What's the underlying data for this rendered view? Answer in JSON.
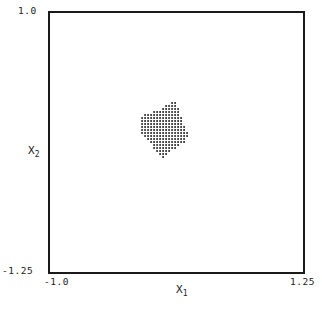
{
  "chart_data": {
    "type": "scatter",
    "title": "",
    "xlabel": "x1",
    "ylabel": "x2",
    "xlim": [
      -1.0,
      1.25
    ],
    "ylim": [
      -1.25,
      1.0
    ],
    "x_ticks": [
      "-1.0",
      "1.25"
    ],
    "y_ticks": [
      "1.0",
      "-1.25"
    ],
    "grid": false,
    "legend": null,
    "point_grid_spacing": 0.027,
    "region": {
      "x_range": [
        -0.21,
        0.23
      ],
      "y_range": [
        -0.25,
        0.22
      ],
      "outline": [
        [
          0.07,
          0.22
        ],
        [
          0.12,
          0.22
        ],
        [
          0.15,
          0.15
        ],
        [
          0.18,
          0.05
        ],
        [
          0.23,
          -0.05
        ],
        [
          0.2,
          -0.12
        ],
        [
          0.1,
          -0.18
        ],
        [
          0.0,
          -0.25
        ],
        [
          -0.06,
          -0.2
        ],
        [
          -0.13,
          -0.1
        ],
        [
          -0.2,
          -0.05
        ],
        [
          -0.21,
          0.05
        ],
        [
          -0.17,
          0.12
        ],
        [
          -0.06,
          0.15
        ],
        [
          0.0,
          0.18
        ]
      ]
    }
  },
  "labels": {
    "x_min": "-1.0",
    "x_max": "1.25",
    "y_max": "1.0",
    "y_min": "-1.25",
    "x_axis": "X",
    "x_axis_sub": "1",
    "y_axis": "X",
    "y_axis_sub": "2"
  }
}
